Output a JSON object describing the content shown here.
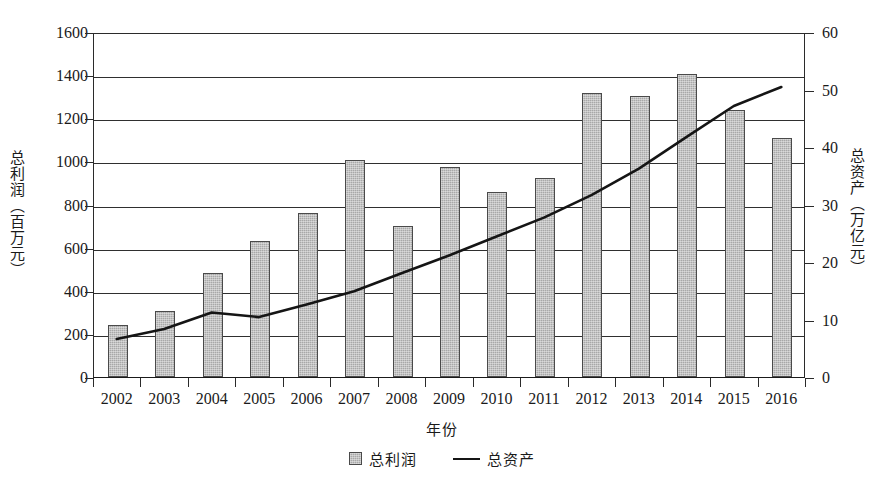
{
  "chart_data": {
    "type": "bar",
    "title": "",
    "xlabel": "年份",
    "ylabel": "总利润（百万元）",
    "ylabel_right": "总资产（万亿元）",
    "categories": [
      "2002",
      "2003",
      "2004",
      "2005",
      "2006",
      "2007",
      "2008",
      "2009",
      "2010",
      "2011",
      "2012",
      "2013",
      "2014",
      "2015",
      "2016"
    ],
    "ylim": [
      0,
      1600
    ],
    "yticks": [
      "0",
      "200",
      "400",
      "600",
      "800",
      "1000",
      "1200",
      "1400",
      "1600"
    ],
    "ylim_right": [
      0,
      60
    ],
    "yticks_right": [
      "0",
      "10",
      "20",
      "30",
      "40",
      "50",
      "60"
    ],
    "grid": true,
    "legend_position": "bottom-center",
    "series": [
      {
        "name": "总利润",
        "kind": "bar",
        "axis": "left",
        "unit": "百万元",
        "color": "#a8a8a8",
        "values": [
          242,
          307,
          483,
          632,
          760,
          1005,
          700,
          972,
          858,
          925,
          1315,
          1305,
          1405,
          1237,
          1110
        ]
      },
      {
        "name": "总资产",
        "kind": "line",
        "axis": "right",
        "unit": "万亿元",
        "color": "#151515",
        "values": [
          6.8,
          8.5,
          11.4,
          10.6,
          12.8,
          15.1,
          18.2,
          21.3,
          24.6,
          27.9,
          31.8,
          36.4,
          41.9,
          47.3,
          50.6
        ]
      }
    ]
  },
  "legend": {
    "items": [
      {
        "label": "总利润",
        "marker": "bar-swatch"
      },
      {
        "label": "总资产",
        "marker": "line-swatch"
      }
    ]
  }
}
